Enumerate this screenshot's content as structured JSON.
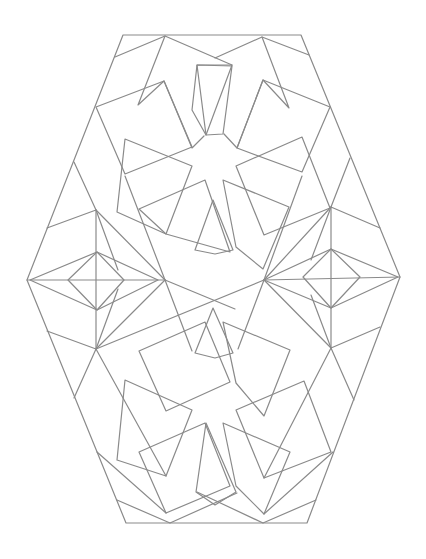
{
  "figure": {
    "title": "Geometric star pattern (hexagonal tile with two eight-point star rosettes)",
    "stroke_color": "#8a8a8a",
    "background": "#ffffff",
    "outer_hexagon": [
      [
        123,
        35
      ],
      [
        301,
        35
      ],
      [
        400,
        277
      ],
      [
        307,
        523
      ],
      [
        126,
        523
      ],
      [
        27,
        280
      ]
    ],
    "upper_star_center": [
      212,
      155
    ],
    "lower_star_center": [
      216,
      398
    ],
    "left_hexagon_center": [
      97,
      280
    ],
    "right_hexagon_center": [
      331,
      277
    ]
  }
}
